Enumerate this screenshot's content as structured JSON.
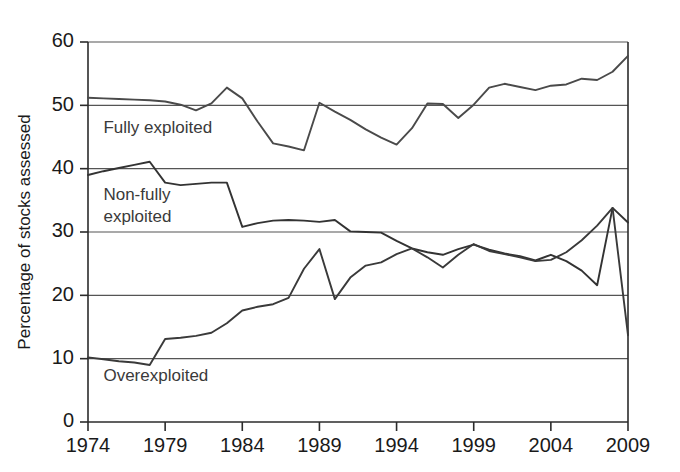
{
  "chart_data": {
    "type": "line",
    "title": "",
    "xlabel": "",
    "ylabel": "Percentage of stocks assessed",
    "xlim": [
      1974,
      2009
    ],
    "ylim": [
      0,
      60
    ],
    "grid": true,
    "grid_axis": "y",
    "legend_position": "inline-annotations",
    "x_tick_labels": [
      "1974",
      "1979",
      "1984",
      "1989",
      "1994",
      "1999",
      "2004",
      "2009"
    ],
    "x_ticks": [
      1974,
      1979,
      1984,
      1989,
      1994,
      1999,
      2004,
      2009
    ],
    "y_tick_labels": [
      "0",
      "10",
      "20",
      "30",
      "40",
      "50",
      "60"
    ],
    "y_ticks": [
      0,
      10,
      20,
      30,
      40,
      50,
      60
    ],
    "x": [
      1974,
      1975,
      1976,
      1977,
      1978,
      1979,
      1980,
      1981,
      1982,
      1983,
      1984,
      1985,
      1986,
      1987,
      1988,
      1989,
      1990,
      1991,
      1992,
      1993,
      1994,
      1995,
      1996,
      1997,
      1998,
      1999,
      2000,
      2001,
      2002,
      2003,
      2004,
      2005,
      2006,
      2007,
      2008,
      2009
    ],
    "series": [
      {
        "name": "Fully exploited",
        "color": "#4a4a4a",
        "label_x": 1975.0,
        "label_y": 47.6,
        "values": [
          51.2,
          51.1,
          51.0,
          50.9,
          50.8,
          50.6,
          50.1,
          49.2,
          50.3,
          52.8,
          51.1,
          47.4,
          44.0,
          43.5,
          42.9,
          50.4,
          49.0,
          47.7,
          46.2,
          44.9,
          43.8,
          46.4,
          50.3,
          50.2,
          48.0,
          50.1,
          52.8,
          53.4,
          52.9,
          52.4,
          53.1,
          53.3,
          54.2,
          54.0,
          55.3,
          57.8
        ]
      },
      {
        "name": "Non-fully exploited",
        "color": "#333333",
        "label_x": 1975.0,
        "label_y": 36.9,
        "values": [
          39.0,
          39.6,
          40.1,
          40.6,
          41.1,
          37.8,
          37.4,
          37.6,
          37.8,
          37.8,
          30.8,
          31.4,
          31.8,
          31.9,
          31.8,
          31.6,
          31.9,
          30.1,
          30.0,
          29.9,
          28.6,
          27.4,
          26.8,
          26.4,
          27.3,
          28.0,
          27.2,
          26.6,
          26.2,
          25.5,
          26.4,
          25.4,
          23.9,
          21.6,
          33.8,
          31.5
        ]
      },
      {
        "name": "Overexploited",
        "color": "#3a3a3a",
        "label_x": 1975.0,
        "label_y": 8.4,
        "values": [
          10.2,
          9.9,
          9.6,
          9.4,
          9.0,
          13.1,
          13.3,
          13.6,
          14.1,
          15.6,
          17.6,
          18.2,
          18.6,
          19.6,
          24.2,
          27.3,
          19.4,
          22.8,
          24.7,
          25.2,
          26.5,
          27.4,
          26.0,
          24.4,
          26.4,
          28.1,
          27.0,
          26.5,
          26.0,
          25.4,
          25.6,
          26.8,
          28.7,
          31.0,
          33.8,
          13.7
        ]
      }
    ]
  },
  "figure": {
    "background_color": "#ffffff",
    "axis_color": "#2b2b2b",
    "grid_color": "#555555"
  }
}
